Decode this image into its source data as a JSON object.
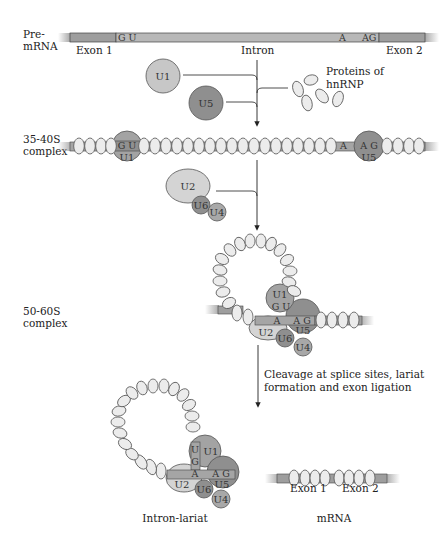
{
  "colors": {
    "exon": "#9e9e9e",
    "intron": "#b5b5b5",
    "bead_fill": "#ececec",
    "bead_stroke": "#555555",
    "snrnp_light": "#c7c7c7",
    "snrnp_dark": "#8f8f8f",
    "line": "#222222"
  },
  "stage1": {
    "label_line1": "Pre-",
    "label_line2": "mRNA",
    "exon1": "Exon 1",
    "intron": "Intron",
    "exon2": "Exon 2",
    "gu": "G U",
    "a": "A",
    "ag": "AG"
  },
  "factors": {
    "u1": "U1",
    "u5": "U5",
    "hnrnp_line1": "Proteins of",
    "hnrnp_line2": "hnRNP"
  },
  "stage2": {
    "label_line1": "35-40S",
    "label_line2": "complex",
    "gu": "G U",
    "u1": "U1",
    "a": "A",
    "ag": "A G",
    "u5": "U5"
  },
  "factors2": {
    "u2": "U2",
    "u6": "U6",
    "u4": "U4"
  },
  "stage3": {
    "label_line1": "50-60S",
    "label_line2": "complex",
    "u1": "U1",
    "gu": "G U",
    "a": "A",
    "ag": "A G",
    "u2": "U2",
    "u5": "U5",
    "u6": "U6",
    "u4": "U4"
  },
  "step": {
    "line1": "Cleavage at splice sites, lariat",
    "line2": "formation and exon ligation"
  },
  "products": {
    "lariat_label": "Intron-lariat",
    "u": "U",
    "g": "G",
    "u1": "U1",
    "a": "A",
    "ag": "A G",
    "u2": "U2",
    "u5": "U5",
    "u6": "U6",
    "u4": "U4",
    "mrna_label": "mRNA",
    "exon1": "Exon 1",
    "exon2": "Exon 2"
  }
}
